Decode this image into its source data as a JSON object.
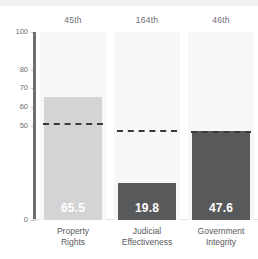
{
  "chart_data": {
    "type": "bar",
    "title": "",
    "xlabel": "",
    "ylabel": "",
    "ylim": [
      0,
      100
    ],
    "grid": false,
    "legend": "none",
    "categories": [
      "Property Rights",
      "Judicial Effectiveness",
      "Government Integrity"
    ],
    "category_lines": [
      [
        "Property",
        "Rights"
      ],
      [
        "Judicial",
        "Effectiveness"
      ],
      [
        "Government",
        "Integrity"
      ]
    ],
    "values": [
      65.5,
      19.8,
      47.6
    ],
    "value_labels": [
      "65.5",
      "19.8",
      "47.6"
    ],
    "ranks": [
      "45th",
      "164th",
      "46th"
    ],
    "reference_lines": [
      51.4,
      47.8,
      47.2
    ],
    "ytick_labels": [
      "100",
      "80",
      "70",
      "60",
      "50",
      "0"
    ],
    "ytick_values": [
      100,
      80,
      70,
      60,
      50,
      0
    ],
    "bar_colors": [
      "#d4d4d6",
      "#58595b",
      "#58595b"
    ],
    "reference_line_color": "#3a3a3c",
    "panel_color": "#f7f7f8",
    "axis_color": "#6d6e71",
    "value_label_color": "#ffffff"
  }
}
